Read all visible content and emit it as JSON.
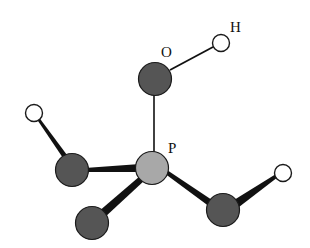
{
  "diagram": {
    "title": "",
    "type": "ball-and-stick molecule",
    "labels": {
      "O": "O",
      "H": "H",
      "P": "P"
    },
    "colors": {
      "background": "#ffffff",
      "phosphorus": "#a8a8a8",
      "oxygen": "#555555",
      "hydrogen": "#ffffff",
      "outline": "#1a1a1a",
      "bond": "#111111"
    },
    "atoms": [
      {
        "id": "P",
        "element": "P",
        "x": 152,
        "y": 168,
        "r": 17
      },
      {
        "id": "O_top",
        "element": "O",
        "x": 155,
        "y": 79,
        "r": 17
      },
      {
        "id": "H_top",
        "element": "H",
        "x": 221,
        "y": 43,
        "r": 9
      },
      {
        "id": "O_left",
        "element": "O",
        "x": 72,
        "y": 170,
        "r": 17
      },
      {
        "id": "H_left",
        "element": "H",
        "x": 34,
        "y": 113,
        "r": 9
      },
      {
        "id": "O_bottom",
        "element": "O",
        "x": 92,
        "y": 223,
        "r": 17
      },
      {
        "id": "O_right",
        "element": "O",
        "x": 223,
        "y": 210,
        "r": 17
      },
      {
        "id": "H_right",
        "element": "H",
        "x": 283,
        "y": 173,
        "r": 9
      }
    ],
    "bonds": [
      {
        "from": "P",
        "to": "O_top",
        "style": "line"
      },
      {
        "from": "O_top",
        "to": "H_top",
        "style": "line"
      },
      {
        "from": "P",
        "to": "O_left",
        "style": "wedge"
      },
      {
        "from": "O_left",
        "to": "H_left",
        "style": "wedge"
      },
      {
        "from": "P",
        "to": "O_bottom",
        "style": "wedge"
      },
      {
        "from": "P",
        "to": "O_right",
        "style": "wedge"
      },
      {
        "from": "O_right",
        "to": "H_right",
        "style": "wedge"
      }
    ]
  }
}
